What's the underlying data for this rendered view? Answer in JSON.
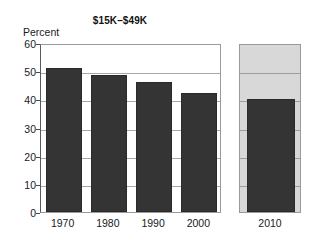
{
  "chart_data": {
    "type": "bar",
    "title": "$15K–$49K",
    "xlabel": "",
    "ylabel": "Percent",
    "ylim": [
      0,
      60
    ],
    "ytick_labels": [
      "0",
      "10",
      "20",
      "30",
      "40",
      "50",
      "60"
    ],
    "yticks": [
      0,
      10,
      20,
      30,
      40,
      50,
      60
    ],
    "gridlines": [
      10,
      20,
      30,
      40,
      50
    ],
    "grid": true,
    "legend": "none",
    "categories": [
      "1970",
      "1980",
      "1990",
      "2000",
      "2010"
    ],
    "values": [
      51.0,
      48.5,
      46.2,
      42.3,
      40.3
    ],
    "series": [
      {
        "name": "Percent",
        "values": [
          51.0,
          48.5,
          46.2,
          42.3,
          40.3
        ]
      }
    ],
    "bars": [
      {
        "category": "1970",
        "value": 51.0,
        "panel": "main"
      },
      {
        "category": "1980",
        "value": 48.5,
        "panel": "main"
      },
      {
        "category": "1990",
        "value": 46.2,
        "panel": "main"
      },
      {
        "category": "2000",
        "value": 42.3,
        "panel": "main"
      },
      {
        "category": "2010",
        "value": 40.3,
        "panel": "projected"
      }
    ]
  },
  "chart": {
    "title": "$15K–$49K",
    "y_axis_label": "Percent",
    "y_labels": [
      "60",
      "50",
      "40",
      "30",
      "20",
      "10",
      "0"
    ],
    "x_labels": [
      "1970",
      "1980",
      "1990",
      "2000",
      "2010"
    ],
    "panel_label": "2010"
  },
  "colors": {
    "bar_fill": "#343434",
    "panel_background": "#d8d8d8",
    "gridline": "#a8a8a8",
    "frame": "#9a9a9a",
    "text": "#1a1a1a",
    "page_background": "#ffffff"
  }
}
